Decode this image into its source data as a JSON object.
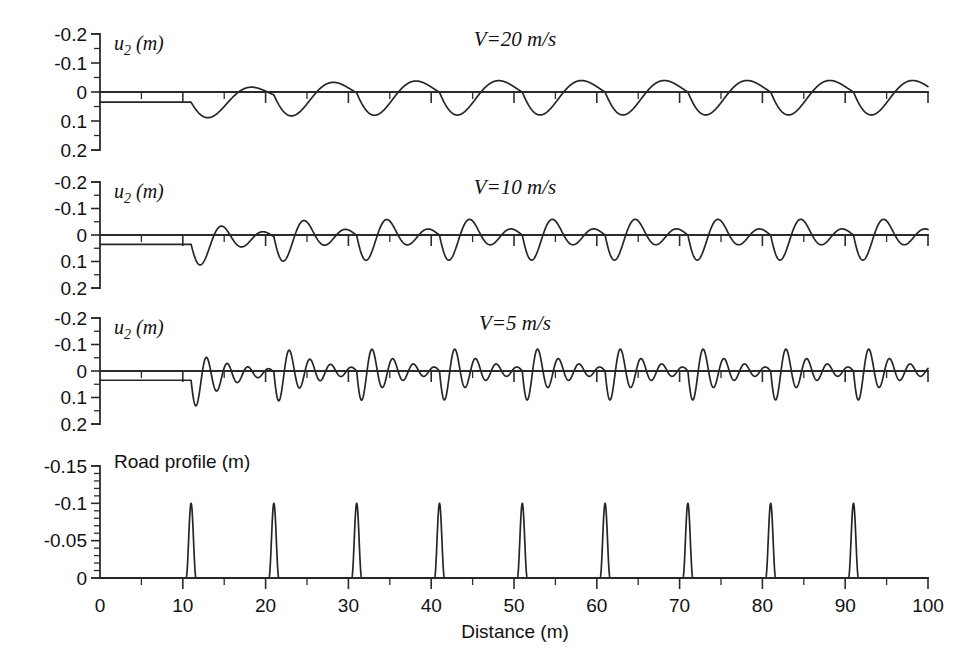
{
  "figure": {
    "background": "#ffffff",
    "ink_color": "#262626",
    "x_axis": {
      "label": "Distance (m)",
      "min": 0,
      "max": 100,
      "major_ticks": [
        0,
        10,
        20,
        30,
        40,
        50,
        60,
        70,
        80,
        90,
        100
      ],
      "tick_labels": [
        "0",
        "10",
        "20",
        "30",
        "40",
        "50",
        "60",
        "70",
        "80",
        "90",
        "100"
      ],
      "minor_tick_step": 5
    }
  },
  "chart_data": [
    {
      "type": "line",
      "name": "response-v20",
      "title": "V=20 m/s",
      "ylabel": "u2 (m)",
      "ylabel_display": "u₂ (m)",
      "xlabel": "",
      "xlim": [
        0,
        100
      ],
      "ylim": [
        -0.2,
        0.2
      ],
      "y_inverted": true,
      "y_major_ticks": [
        -0.2,
        -0.1,
        0,
        0.1,
        0.2
      ],
      "y_tick_labels": [
        "-0.2",
        "-0.1",
        "0",
        "0.1",
        "0.2"
      ],
      "y_minor_tick_step": 0.05,
      "grid": false,
      "legend": "none",
      "static_offset": 0.035,
      "excitation_start": 11,
      "bump_spacing": 10,
      "cycles_per_bump": 1,
      "damping_ratio": 0.22,
      "peak_amplitude": 0.085,
      "steady_amplitude": 0.072,
      "annotation": "Vehicle body vertical displacement at 20 m/s; about one oscillation cycle between successive bumps."
    },
    {
      "type": "line",
      "name": "response-v10",
      "title": "V=10 m/s",
      "ylabel": "u2 (m)",
      "ylabel_display": "u₂ (m)",
      "xlabel": "",
      "xlim": [
        0,
        100
      ],
      "ylim": [
        -0.2,
        0.2
      ],
      "y_inverted": true,
      "y_major_ticks": [
        -0.2,
        -0.1,
        0,
        0.1,
        0.2
      ],
      "y_tick_labels": [
        "-0.2",
        "-0.1",
        "0",
        "0.1",
        "0.2"
      ],
      "y_minor_tick_step": 0.05,
      "grid": false,
      "legend": "none",
      "static_offset": 0.035,
      "excitation_start": 11,
      "bump_spacing": 10,
      "cycles_per_bump": 2,
      "damping_ratio": 0.15,
      "peak_amplitude": 0.105,
      "steady_amplitude": 0.075,
      "annotation": "Vehicle body vertical displacement at 10 m/s; about two oscillation cycles between successive bumps."
    },
    {
      "type": "line",
      "name": "response-v5",
      "title": "V=5 m/s",
      "ylabel": "u2 (m)",
      "ylabel_display": "u₂ (m)",
      "xlabel": "",
      "xlim": [
        0,
        100
      ],
      "ylim": [
        -0.2,
        0.2
      ],
      "y_inverted": true,
      "y_major_ticks": [
        -0.2,
        -0.1,
        0,
        0.1,
        0.2
      ],
      "y_tick_labels": [
        "-0.2",
        "-0.1",
        "0",
        "0.1",
        "0.2"
      ],
      "y_minor_tick_step": 0.05,
      "grid": false,
      "legend": "none",
      "static_offset": 0.035,
      "excitation_start": 11,
      "bump_spacing": 10,
      "cycles_per_bump": 4,
      "damping_ratio": 0.09,
      "peak_amplitude": 0.115,
      "steady_amplitude": 0.09,
      "annotation": "Vehicle body vertical displacement at 5 m/s; about four oscillation cycles between successive bumps."
    },
    {
      "type": "line",
      "name": "road-profile",
      "title": "",
      "ylabel": "Road profile (m)",
      "xlabel": "Distance (m)",
      "xlim": [
        0,
        100
      ],
      "ylim": [
        -0.15,
        0
      ],
      "y_inverted": true,
      "y_major_ticks": [
        -0.15,
        -0.1,
        -0.05,
        0
      ],
      "y_tick_labels": [
        "-0.15",
        "-0.1",
        "-0.05",
        "0"
      ],
      "y_minor_tick_step": 0.01,
      "grid": false,
      "legend": "none",
      "bump_positions": [
        11,
        21,
        31,
        41,
        51,
        61,
        71,
        81,
        91
      ],
      "bump_height": -0.1,
      "bump_width": 1.2,
      "baseline": 0,
      "annotation": "Periodic road bumps of 0.1 m height spaced every 10 m starting at 11 m."
    }
  ]
}
